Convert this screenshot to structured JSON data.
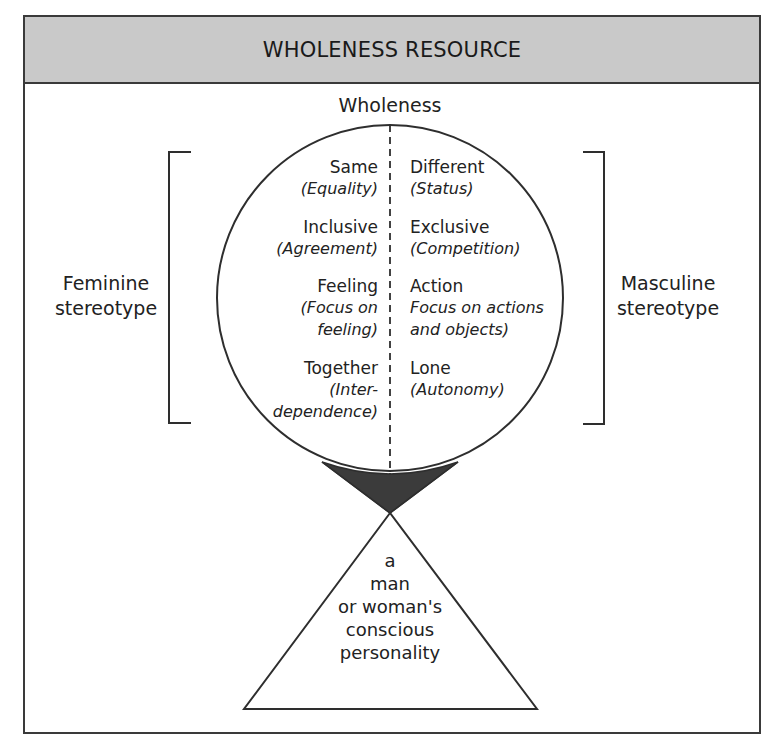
{
  "header": {
    "title": "WHOLENESS RESOURCE"
  },
  "diagram": {
    "top_label": "Wholeness",
    "left_label": {
      "line1": "Feminine",
      "line2": "stereotype"
    },
    "right_label": {
      "line1": "Masculine",
      "line2": "stereotype"
    },
    "pairs": [
      {
        "left_term": "Same",
        "left_note": [
          "(Equality)"
        ],
        "right_term": "Different",
        "right_note": [
          "(Status)"
        ]
      },
      {
        "left_term": "Inclusive",
        "left_note": [
          "(Agreement)"
        ],
        "right_term": "Exclusive",
        "right_note": [
          "(Competition)"
        ]
      },
      {
        "left_term": "Feeling",
        "left_note": [
          "(Focus on",
          "feeling)"
        ],
        "right_term": "Action",
        "right_note": [
          "Focus on actions",
          "and objects)"
        ]
      },
      {
        "left_term": "Together",
        "left_note": [
          "(Inter-",
          "dependence)"
        ],
        "right_term": "Lone",
        "right_note": [
          "(Autonomy)"
        ]
      }
    ],
    "triangle_text": [
      "a",
      "man",
      "or woman's",
      "conscious",
      "personality"
    ],
    "colors": {
      "header_fill": "#c9c9c9",
      "line": "#2e2e2e",
      "wedge_fill": "#3b3b3b"
    }
  }
}
